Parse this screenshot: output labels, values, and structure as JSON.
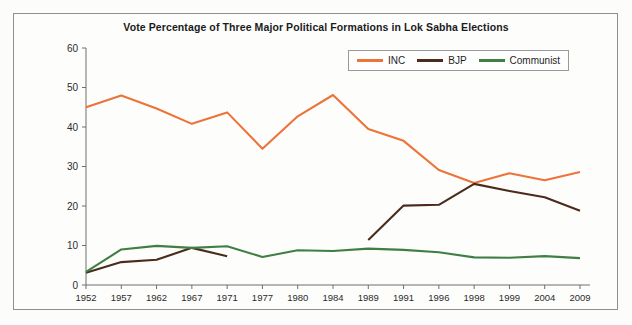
{
  "figure": {
    "title": "Vote Percentage of Three Major Political Formations in Lok Sabha Elections",
    "background_color": "#fcfcfb",
    "frame_color": "#8f8f8f"
  },
  "legend": {
    "position": "top-right",
    "entries": [
      {
        "label": "INC",
        "color": "#ed7338",
        "icon": "line-swatch-icon"
      },
      {
        "label": "BJP",
        "color": "#4a2b1c",
        "icon": "line-swatch-icon"
      },
      {
        "label": "Communist",
        "color": "#3f7f44",
        "icon": "line-swatch-icon"
      }
    ]
  },
  "axes": {
    "y": {
      "label": "",
      "min": 0,
      "max": 60,
      "ticks": [
        0,
        10,
        20,
        30,
        40,
        50,
        60
      ],
      "tick_labels": [
        "0",
        "10",
        "20",
        "30",
        "40",
        "50",
        "60"
      ]
    },
    "x": {
      "label": "",
      "tick_labels": [
        "1952",
        "1957",
        "1962",
        "1967",
        "1971",
        "1977",
        "1980",
        "1984",
        "1989",
        "1991",
        "1996",
        "1998",
        "1999",
        "2004",
        "2009"
      ]
    },
    "grid": false
  },
  "chart_data": {
    "type": "line",
    "title": "Vote Percentage of Three Major Political Formations in Lok Sabha Elections",
    "xlabel": "",
    "ylabel": "",
    "ylim": [
      0,
      60
    ],
    "grid": false,
    "legend_position": "top-right",
    "categories": [
      "1952",
      "1957",
      "1962",
      "1967",
      "1971",
      "1977",
      "1980",
      "1984",
      "1989",
      "1991",
      "1996",
      "1998",
      "1999",
      "2004",
      "2009"
    ],
    "series": [
      {
        "name": "INC",
        "color": "#ed7338",
        "values": [
          45.0,
          48.0,
          44.7,
          40.8,
          43.7,
          34.5,
          42.7,
          48.1,
          39.5,
          36.5,
          29.1,
          25.8,
          28.3,
          26.5,
          28.6
        ]
      },
      {
        "name": "BJP",
        "color": "#4a2b1c",
        "values": [
          3.1,
          5.8,
          6.4,
          9.4,
          7.3,
          null,
          null,
          null,
          11.4,
          20.1,
          20.3,
          25.6,
          23.8,
          22.2,
          18.8
        ]
      },
      {
        "name": "Communist",
        "color": "#3f7f44",
        "values": [
          3.3,
          9.0,
          9.9,
          9.4,
          9.8,
          7.1,
          8.8,
          8.6,
          9.2,
          8.9,
          8.3,
          7.0,
          6.9,
          7.3,
          6.8
        ]
      }
    ]
  }
}
